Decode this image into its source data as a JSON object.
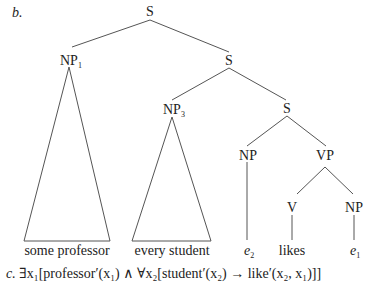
{
  "example_label_b": "b.",
  "example_label_c": "c.",
  "tree": {
    "root": "S",
    "np1": {
      "label": "NP",
      "index": "1",
      "leaf": "some professor"
    },
    "s2": "S",
    "np3": {
      "label": "NP",
      "index": "3",
      "leaf": "every student"
    },
    "s3": "S",
    "np_trace": {
      "label": "NP",
      "leaf_var": "e",
      "leaf_index": "2"
    },
    "vp": "VP",
    "v": {
      "label": "V",
      "leaf": "likes"
    },
    "np_obj": {
      "label": "NP",
      "leaf_var": "e",
      "leaf_index": "1"
    }
  },
  "formula": "∃x₁[professor′(x₁) ∧ ∀x₂[student′(x₂) → like′(x₂, x₁)]]"
}
